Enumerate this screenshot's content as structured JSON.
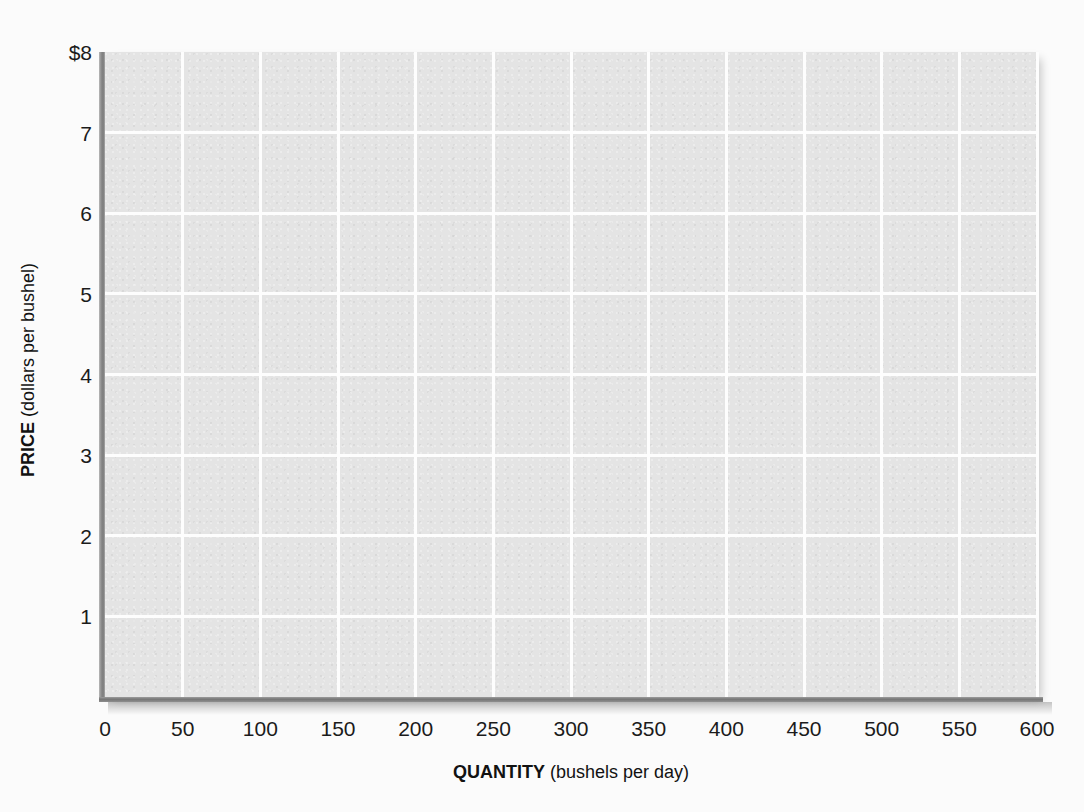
{
  "chart_data": {
    "type": "line",
    "title": "",
    "subtitle": "",
    "xlabel_strong": "QUANTITY",
    "xlabel_rest": " (bushels per day)",
    "ylabel_strong": "PRICE",
    "ylabel_rest": " (dollars per bushel)",
    "xlim": [
      0,
      600
    ],
    "ylim": [
      0,
      8
    ],
    "grid": true,
    "legend_position": "none",
    "xticks": [
      {
        "value": 0,
        "label": "0"
      },
      {
        "value": 50,
        "label": "50"
      },
      {
        "value": 100,
        "label": "100"
      },
      {
        "value": 150,
        "label": "150"
      },
      {
        "value": 200,
        "label": "200"
      },
      {
        "value": 250,
        "label": "250"
      },
      {
        "value": 300,
        "label": "300"
      },
      {
        "value": 350,
        "label": "350"
      },
      {
        "value": 400,
        "label": "400"
      },
      {
        "value": 450,
        "label": "450"
      },
      {
        "value": 500,
        "label": "500"
      },
      {
        "value": 550,
        "label": "550"
      },
      {
        "value": 600,
        "label": "600"
      }
    ],
    "yticks": [
      {
        "value": 8,
        "label": "$8"
      },
      {
        "value": 7,
        "label": "7"
      },
      {
        "value": 6,
        "label": "6"
      },
      {
        "value": 5,
        "label": "5"
      },
      {
        "value": 4,
        "label": "4"
      },
      {
        "value": 3,
        "label": "3"
      },
      {
        "value": 2,
        "label": "2"
      },
      {
        "value": 1,
        "label": "1"
      }
    ],
    "series": [],
    "annotations": [],
    "colors": {
      "page_background": "#fbfbfb",
      "plot_background": "#e4e4e4",
      "gridline": "#fdfdfd",
      "axis_line": "#7c7c7c",
      "tick_label": "#1b1b1b",
      "axis_title": "#121212"
    }
  }
}
